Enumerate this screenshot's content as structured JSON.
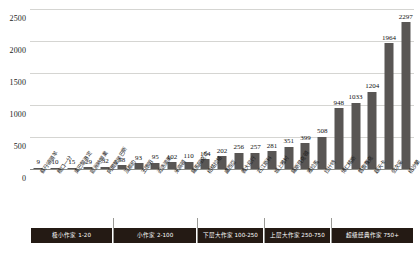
{
  "chart_data": {
    "type": "bar",
    "title": "",
    "subtitle": "",
    "xlabel": "",
    "ylabel": "",
    "ylim": [
      0,
      2500
    ],
    "grid": true,
    "legend_position": "bottom-bands",
    "bar_color": "#595654",
    "categories": [
      "蘇丹領頭羊",
      "糖口一分",
      "東巴黎港定",
      "歐洲時興業",
      "阿爾蘭居巴斯",
      "沒都約",
      "王德明",
      "近迭滴果",
      "米高頓",
      "羅馬阿克坎",
      "柏格拉格",
      "盧西亞",
      "義大尼行",
      "石江斯科",
      "城上雅村",
      "羅斯貝克頓",
      "雅拉馬",
      "拉什特",
      "博仁精斯",
      "普魯賽克",
      "超天卡",
      "伯次采",
      "柏沙蘭"
    ],
    "values": [
      9,
      10,
      15,
      29,
      32,
      58,
      93,
      95,
      102,
      110,
      154,
      202,
      256,
      257,
      281,
      351,
      399,
      508,
      948,
      1033,
      1204,
      1964,
      2297
    ],
    "y_ticks": [
      0,
      500,
      1000,
      1500,
      2000,
      2500
    ],
    "y_tick_labels": [
      "0",
      "500",
      "1000",
      "1500",
      "2000",
      "2500"
    ],
    "value_labels": [
      "9",
      "10",
      "15",
      "29",
      "32",
      "58",
      "93",
      "95",
      "102",
      "110",
      "154",
      "202",
      "256",
      "257",
      "281",
      "351",
      "399",
      "508",
      "948",
      "1033",
      "1204",
      "1964",
      "2297"
    ],
    "bands": [
      {
        "label": "极小作家 1-20",
        "start_index": 0,
        "end_index": 4
      },
      {
        "label": "小作家 2-100",
        "start_index": 5,
        "end_index": 9
      },
      {
        "label": "下层大作家 100-250",
        "start_index": 10,
        "end_index": 13
      },
      {
        "label": "上层大作家 250-750",
        "start_index": 14,
        "end_index": 17
      },
      {
        "label": "超级经典作家 750+",
        "start_index": 18,
        "end_index": 22
      }
    ]
  }
}
